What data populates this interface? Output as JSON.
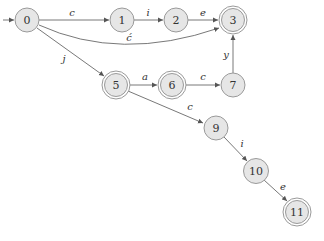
{
  "diagram": {
    "type": "finite-state-automaton",
    "colors": {
      "node_fill": "#e6e6e6",
      "node_stroke": "#9a9a9a",
      "edge": "#555555",
      "text": "#333333"
    },
    "start_state": "0",
    "nodes": [
      {
        "id": "0",
        "label": "0",
        "x": 27,
        "y": 20,
        "accepting": false
      },
      {
        "id": "1",
        "label": "1",
        "x": 122,
        "y": 20,
        "accepting": false
      },
      {
        "id": "2",
        "label": "2",
        "x": 176,
        "y": 20,
        "accepting": false
      },
      {
        "id": "3",
        "label": "3",
        "x": 233,
        "y": 20,
        "accepting": true
      },
      {
        "id": "5",
        "label": "5",
        "x": 116,
        "y": 85,
        "accepting": true
      },
      {
        "id": "6",
        "label": "6",
        "x": 172,
        "y": 85,
        "accepting": true
      },
      {
        "id": "7",
        "label": "7",
        "x": 233,
        "y": 85,
        "accepting": false
      },
      {
        "id": "9",
        "label": "9",
        "x": 216,
        "y": 128,
        "accepting": false
      },
      {
        "id": "10",
        "label": "10",
        "x": 256,
        "y": 171,
        "accepting": false
      },
      {
        "id": "11",
        "label": "11",
        "x": 297,
        "y": 212,
        "accepting": true
      }
    ],
    "edges": [
      {
        "from": "0",
        "to": "1",
        "label": "c"
      },
      {
        "from": "1",
        "to": "2",
        "label": "i"
      },
      {
        "from": "2",
        "to": "3",
        "label": "e"
      },
      {
        "from": "0",
        "to": "3",
        "label": "ć",
        "curved": true
      },
      {
        "from": "0",
        "to": "5",
        "label": "j"
      },
      {
        "from": "5",
        "to": "6",
        "label": "a"
      },
      {
        "from": "6",
        "to": "7",
        "label": "c"
      },
      {
        "from": "7",
        "to": "3",
        "label": "y"
      },
      {
        "from": "5",
        "to": "9",
        "label": "c"
      },
      {
        "from": "9",
        "to": "10",
        "label": "i"
      },
      {
        "from": "10",
        "to": "11",
        "label": "e"
      }
    ]
  }
}
